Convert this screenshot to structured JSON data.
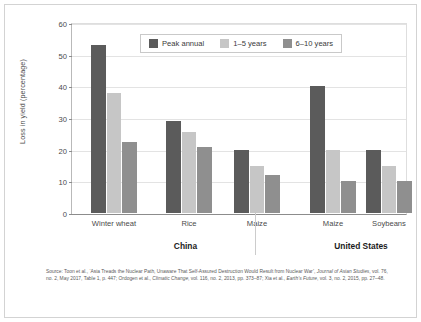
{
  "chart_data": {
    "type": "bar",
    "title": "",
    "xlabel": "",
    "ylabel": "Loss in yield (percentage)",
    "ylim": [
      0,
      60
    ],
    "yticks": [
      0,
      10,
      20,
      30,
      40,
      50,
      60
    ],
    "grid": true,
    "legend_position": "top-center",
    "categories": [
      "Winter wheat",
      "Rice",
      "Maize",
      "Maize",
      "Soybeans"
    ],
    "groups": [
      {
        "name": "China",
        "categories": [
          "Winter wheat",
          "Rice",
          "Maize"
        ]
      },
      {
        "name": "United States",
        "categories": [
          "Maize",
          "Soybeans"
        ]
      }
    ],
    "series": [
      {
        "name": "Peak annual",
        "color": "#5b5b5b",
        "values": [
          53,
          29,
          20,
          40,
          20
        ]
      },
      {
        "name": "1–5 years",
        "color": "#c6c6c6",
        "values": [
          38,
          25.5,
          15,
          20,
          15
        ]
      },
      {
        "name": "6–10 years",
        "color": "#8f8f8f",
        "values": [
          22.5,
          21,
          12,
          10,
          10
        ]
      }
    ]
  },
  "legend": {
    "items": [
      {
        "label": "Peak annual"
      },
      {
        "label": "1–5 years"
      },
      {
        "label": "6–10 years"
      }
    ]
  },
  "axis": {
    "y_title": "Loss in yield (percentage)",
    "y_tick_labels": [
      "0",
      "10",
      "20",
      "30",
      "40",
      "50",
      "60"
    ]
  },
  "group_labels": [
    "China",
    "United States"
  ],
  "category_labels": [
    "Winter wheat",
    "Rice",
    "Maize",
    "Maize",
    "Soybeans"
  ],
  "source": {
    "line1_a": "Source: Toon et al., ‘Asia Treads the Nuclear Path, Unaware That Self-Assured Destruction Would Result from Nuclear War’, ",
    "line1_b": "Journal of Asian Studies",
    "line1_c": ", vol. 76, no. 2, May 2017, Table 1, p. 447; Ordogen et al., ",
    "line2_a": "Climatic Change",
    "line2_b": ", vol. 116, no. 2, 2013, pp. 373–87; Xia et al., ",
    "line2_c": "Earth’s Future",
    "line2_d": ", vol. 3, no. 2, 2015, pp. 27–48."
  }
}
